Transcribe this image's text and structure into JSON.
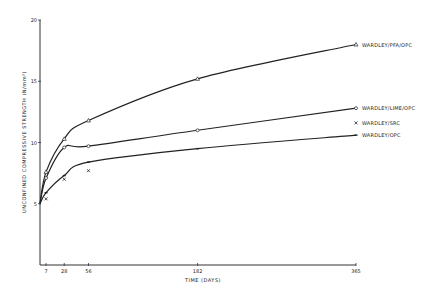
{
  "chart_data": {
    "type": "line",
    "title": "",
    "xlabel": "TIME (DAYS)",
    "ylabel": "UNCONFINED COMPRESSIVE STRENGTH (N/mm²)",
    "xlim": [
      0,
      365
    ],
    "ylim": [
      0,
      20
    ],
    "x_ticks": [
      7,
      28,
      56,
      182,
      365
    ],
    "y_ticks": [
      5,
      10,
      15,
      20
    ],
    "grid": false,
    "legend_position": "inline-right",
    "series": [
      {
        "name": "WARDLEY/PFA/OPC",
        "marker": "triangle",
        "x": [
          0,
          7,
          28,
          56,
          182,
          365
        ],
        "values": [
          5.0,
          7.6,
          10.3,
          11.8,
          15.2,
          18.0
        ]
      },
      {
        "name": "WARDLEY/LIME/OPC",
        "marker": "circle",
        "x": [
          0,
          7,
          28,
          56,
          182,
          365
        ],
        "values": [
          5.0,
          7.1,
          9.6,
          9.7,
          11.0,
          12.8
        ]
      },
      {
        "name": "WARDLEY/SRC",
        "marker": "cross",
        "line": false,
        "x": [
          0,
          7,
          28,
          56,
          365
        ],
        "values": [
          5.0,
          5.4,
          7.0,
          7.7,
          11.6
        ]
      },
      {
        "name": "WARDLEY/OPC",
        "marker": "dash",
        "x": [
          0,
          7,
          28,
          56,
          182,
          365
        ],
        "values": [
          5.0,
          5.9,
          7.3,
          8.4,
          9.5,
          10.6
        ]
      }
    ]
  }
}
